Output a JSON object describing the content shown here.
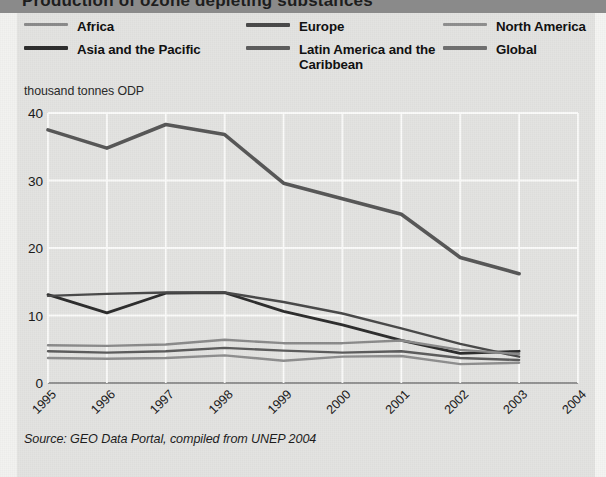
{
  "titlebar": {
    "cropped_title": "Production of ozone depleting substances"
  },
  "legend": {
    "columns": [
      {
        "items": [
          {
            "label": "Africa",
            "color": "#8b8b8b",
            "thickness": 3
          },
          {
            "label": "Asia and the Pacific",
            "color": "#2e2e2e",
            "thickness": 4
          }
        ]
      },
      {
        "items": [
          {
            "label": "Europe",
            "color": "#4a4a4a",
            "thickness": 4
          },
          {
            "label": "Latin America and the\nCaribbean",
            "color": "#5d5d5d",
            "thickness": 4
          }
        ]
      },
      {
        "items": [
          {
            "label": "North America",
            "color": "#8f8f8f",
            "thickness": 3
          },
          {
            "label": "Global",
            "color": "#707070",
            "thickness": 4
          }
        ]
      }
    ]
  },
  "axis": {
    "unit_caption": "thousand tonnes ODP",
    "y_ticks": [
      "40",
      "30",
      "20",
      "10",
      "0"
    ],
    "x_ticks": [
      "1995",
      "1996",
      "1997",
      "1998",
      "1999",
      "2000",
      "2001",
      "2002",
      "2003",
      "2004"
    ]
  },
  "source": {
    "text": "Source: GEO Data Portal, compiled from UNEP 2004"
  },
  "colors": {
    "panel_bg": "#e3e3e1",
    "titlebar_bg": "#8a8a8a",
    "gridline": "#fbfbfa",
    "axis_line": "#6f6f6f"
  },
  "chart_data": {
    "type": "line",
    "title": "Production of ozone depleting substances",
    "xlabel": "",
    "ylabel": "thousand tonnes ODP",
    "ylim": [
      0,
      40
    ],
    "xlim": [
      "1995",
      "2004"
    ],
    "grid": true,
    "legend_position": "top",
    "x": [
      "1995",
      "1996",
      "1997",
      "1998",
      "1999",
      "2000",
      "2001",
      "2002",
      "2003"
    ],
    "series": [
      {
        "name": "Global",
        "color": "#585858",
        "width": 3.6,
        "values": [
          37.5,
          34.8,
          38.3,
          36.8,
          29.6,
          27.3,
          25.0,
          18.6,
          16.2
        ]
      },
      {
        "name": "Asia and the Pacific",
        "color": "#2e2e2e",
        "width": 2.8,
        "values": [
          13.1,
          10.4,
          13.3,
          13.4,
          10.6,
          8.6,
          6.3,
          4.4,
          4.7
        ]
      },
      {
        "name": "Europe",
        "color": "#4a4a4a",
        "width": 2.4,
        "values": [
          12.9,
          13.2,
          13.4,
          13.4,
          12.0,
          10.3,
          8.1,
          5.8,
          3.9
        ]
      },
      {
        "name": "Africa",
        "color": "#8b8b8b",
        "width": 2.4,
        "values": [
          5.6,
          5.5,
          5.7,
          6.4,
          5.9,
          5.9,
          6.3,
          4.9,
          4.3
        ]
      },
      {
        "name": "Latin America and the Caribbean",
        "color": "#5d5d5d",
        "width": 2.4,
        "values": [
          4.7,
          4.5,
          4.7,
          5.2,
          4.8,
          4.5,
          4.7,
          3.7,
          3.4
        ]
      },
      {
        "name": "North America",
        "color": "#8f8f8f",
        "width": 2.4,
        "values": [
          3.7,
          3.6,
          3.7,
          4.1,
          3.3,
          3.9,
          4.0,
          2.8,
          3.0
        ]
      }
    ]
  }
}
